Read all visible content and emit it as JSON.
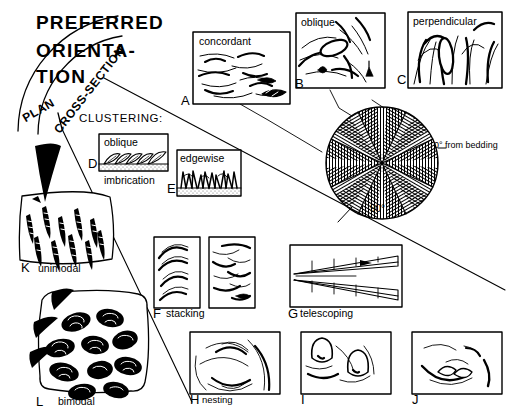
{
  "figure": {
    "title_lines": [
      "PREFERRED",
      "ORIENTA-",
      "TION"
    ],
    "arc_labels": {
      "plan": "PLAN",
      "cross_section": "CROSS-SECTION"
    },
    "section_heading": "CLUSTERING:",
    "rose": {
      "zero_label": "0° from bedding",
      "ninety_label": "90°",
      "wedge_count": 12,
      "hatch_alternating": [
        "vertical",
        "horizontal"
      ]
    }
  },
  "panels": [
    {
      "key": "A",
      "box_label": "concordant",
      "caption": "",
      "name": "panel-a-concordant"
    },
    {
      "key": "B",
      "box_label": "oblique",
      "caption": "",
      "name": "panel-b-oblique"
    },
    {
      "key": "C",
      "box_label": "perpendicular",
      "caption": "",
      "name": "panel-c-perpendicular"
    },
    {
      "key": "D",
      "box_label": "oblique",
      "caption": "imbrication",
      "name": "panel-d-imbrication"
    },
    {
      "key": "E",
      "box_label": "edgewise",
      "caption": "",
      "name": "panel-e-edgewise"
    },
    {
      "key": "F",
      "box_label": "",
      "caption": "stacking",
      "name": "panel-f-stacking"
    },
    {
      "key": "G",
      "box_label": "",
      "caption": "telescoping",
      "name": "panel-g-telescoping"
    },
    {
      "key": "H",
      "box_label": "",
      "caption": "nesting",
      "name": "panel-h-nesting"
    },
    {
      "key": "I",
      "box_label": "",
      "caption": "",
      "name": "panel-i"
    },
    {
      "key": "J",
      "box_label": "",
      "caption": "",
      "name": "panel-j"
    },
    {
      "key": "K",
      "box_label": "",
      "caption": "unimodal",
      "name": "panel-k-unimodal"
    },
    {
      "key": "L",
      "box_label": "",
      "caption": "bimodal",
      "name": "panel-l-bimodal"
    }
  ],
  "colors": {
    "ink": "#000000",
    "paper": "#ffffff",
    "hatch": "#111111"
  }
}
